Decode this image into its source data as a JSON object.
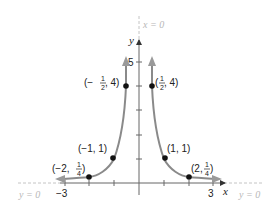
{
  "figure": {
    "function": "y = 1/x^2",
    "axes": {
      "x_label": "x",
      "y_label": "y",
      "x_ticks": [
        -3,
        -2,
        -1,
        1,
        2,
        3
      ],
      "x_tick_labels": [
        "−3",
        "3"
      ],
      "y_ticks": [
        1,
        2,
        3,
        4,
        5
      ],
      "y_tick_labels": [
        "5"
      ]
    },
    "asymptotes": [
      {
        "label": "x = 0",
        "type": "vertical"
      },
      {
        "label_left": "y = 0",
        "label_right": "y = 0",
        "type": "horizontal"
      }
    ],
    "points": [
      {
        "x": -0.5,
        "y": 4,
        "label_prefix": "(−",
        "label_num": "1",
        "label_den": "2",
        "label_suffix": ", 4)"
      },
      {
        "x": 0.5,
        "y": 4,
        "label_prefix": "(",
        "label_num": "1",
        "label_den": "2",
        "label_suffix": ", 4)"
      },
      {
        "x": -1,
        "y": 1,
        "label": "(−1, 1)"
      },
      {
        "x": 1,
        "y": 1,
        "label": "(1, 1)"
      },
      {
        "x": -2,
        "y": 0.25,
        "label_prefix": "(−2, ",
        "label_num": "1",
        "label_den": "4",
        "label_suffix": ")"
      },
      {
        "x": 2,
        "y": 0.25,
        "label_prefix": "(2, ",
        "label_num": "1",
        "label_den": "4",
        "label_suffix": ")"
      }
    ],
    "colors": {
      "curve": "#8a8a8a",
      "axis": "#666666",
      "asymptote": "#c4c4c4",
      "point": "#111111"
    }
  }
}
